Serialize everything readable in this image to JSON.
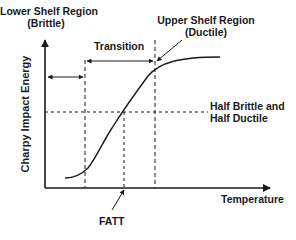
{
  "diagram": {
    "axes": {
      "y_label": "Charpy Impact Energy",
      "x_label": "Temperature"
    },
    "regions": {
      "lower_shelf": {
        "line1": "Lower Shelf Region",
        "line2": "(Brittle)"
      },
      "transition": "Transition",
      "upper_shelf": {
        "line1": "Upper Shelf Region",
        "line2": "(Ductile)"
      }
    },
    "reference_line": {
      "line1": "Half Brittle and",
      "line2": "Half Ductile"
    },
    "marker": "FATT",
    "colors": {
      "line": "#1a1a1a",
      "background": "#ffffff"
    }
  }
}
